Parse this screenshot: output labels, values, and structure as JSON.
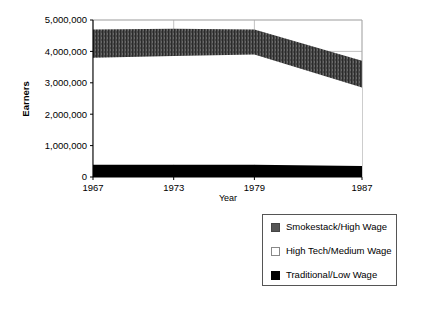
{
  "chart_data": {
    "type": "area",
    "stacked": true,
    "title": "",
    "xlabel": "Year",
    "ylabel": "Earners",
    "x": [
      1967,
      1973,
      1979,
      1987
    ],
    "xticklabels": [
      "1967",
      "1973",
      "1979",
      "1987"
    ],
    "ylim": [
      0,
      5000000
    ],
    "yticks": [
      0,
      1000000,
      2000000,
      3000000,
      4000000,
      5000000
    ],
    "yticklabels": [
      "0",
      "1,000,000",
      "2,000,000",
      "3,000,000",
      "4,000,000",
      "5,000,000"
    ],
    "grid": "horizontal-and-vertical-light",
    "legend_position": "bottom-right",
    "series": [
      {
        "name": "Traditional/Low Wage",
        "color": "#000000",
        "swatch": "sw-black",
        "values": [
          390000,
          390000,
          390000,
          350000
        ],
        "band_lower": [
          0,
          0,
          0,
          0
        ],
        "band_upper": [
          390000,
          390000,
          390000,
          350000
        ]
      },
      {
        "name": "High Tech/Medium Wage",
        "color": "#ffffff",
        "swatch": "sw-white",
        "values": [
          3410000,
          3460000,
          3510000,
          2500000
        ],
        "band_lower": [
          390000,
          390000,
          390000,
          350000
        ],
        "band_upper": [
          3800000,
          3850000,
          3900000,
          2850000
        ]
      },
      {
        "name": "Smokestack/High Wage",
        "color": "#555555",
        "swatch": "sw-gray",
        "values": [
          900000,
          870000,
          800000,
          850000
        ],
        "band_lower": [
          3800000,
          3850000,
          3900000,
          2850000
        ],
        "band_upper": [
          4700000,
          4720000,
          4700000,
          3700000
        ]
      }
    ]
  },
  "legend": {
    "items": [
      {
        "label": "Smokestack/High Wage",
        "swatch": "sw-gray"
      },
      {
        "label": "High Tech/Medium Wage",
        "swatch": "sw-white"
      },
      {
        "label": "Traditional/Low Wage",
        "swatch": "sw-black"
      }
    ]
  }
}
